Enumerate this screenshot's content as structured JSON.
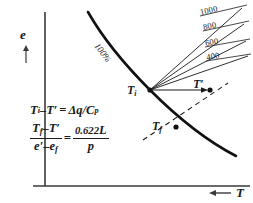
{
  "figure": {
    "background_color": "#ffffff",
    "ink_color": "#1a1a1a"
  },
  "axes": {
    "y_label": "e",
    "y_arrow": "up-arrow",
    "x_label": "T",
    "x_arrow": "left-arrow"
  },
  "curve": {
    "label": "100%",
    "description": "saturation vapor pressure curve"
  },
  "points": [
    {
      "id": "Ti",
      "label_main": "T",
      "label_sub": "i",
      "label_prime": ""
    },
    {
      "id": "Tf",
      "label_main": "T",
      "label_sub": "f",
      "label_prime": ""
    },
    {
      "id": "Tprime",
      "label_main": "T",
      "label_sub": "",
      "label_prime": "′"
    }
  ],
  "fan_lines": [
    {
      "label": "1000"
    },
    {
      "label": "800"
    },
    {
      "label": "600"
    },
    {
      "label": "400"
    }
  ],
  "equations": {
    "eq1": {
      "lhs_t1": "T",
      "lhs_t1_sub": "i",
      "minus": "–",
      "lhs_t2": "T",
      "lhs_t2_prime": "′",
      "equals": "=",
      "rhs_delta": "Δq",
      "rhs_slash": "/",
      "rhs_c": "C",
      "rhs_c_sub": "p"
    },
    "eq2": {
      "num_t1": "T",
      "num_t1_sub": "f",
      "num_minus": "–",
      "num_t2": "T",
      "num_t2_prime": "′",
      "den_e1": "e",
      "den_e1_prime": "′",
      "den_minus": "–",
      "den_e2": "e",
      "den_e2_sub": "f",
      "equals": "=",
      "rhs_num_const": "0.622",
      "rhs_num_l": "L",
      "rhs_den": "p"
    }
  }
}
